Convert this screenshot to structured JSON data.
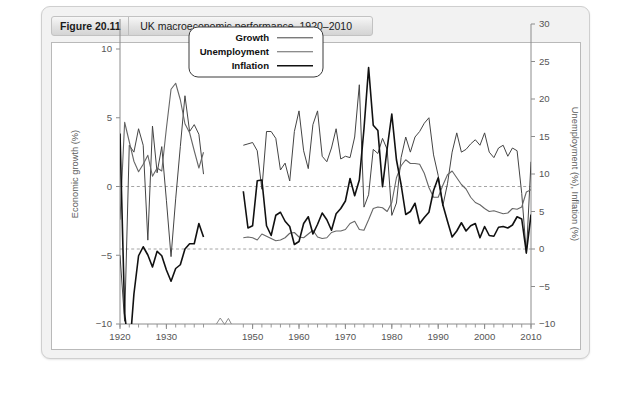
{
  "figure": {
    "number": "Figure 20.11",
    "title": "UK macroeconomic performance, 1920–2010"
  },
  "chart_data": {
    "type": "line",
    "title": "UK macroeconomic performance, 1920–2010",
    "xlabel": "",
    "ylabel": "Economic growth (%)",
    "y2label": "Unemployment (%), Inflation (%)",
    "xlim": [
      1920,
      2010
    ],
    "ylim": [
      -10,
      12
    ],
    "y2lim": [
      -10,
      30
    ],
    "grid": false,
    "zero_reference_lines": [
      {
        "axis": "left",
        "value": 0,
        "style": "dashed"
      },
      {
        "axis": "right",
        "value": 0,
        "style": "dashed"
      }
    ],
    "axis_break": {
      "between": [
        1938,
        1948
      ],
      "marker": "zigzag-notch"
    },
    "xticks": [
      1920,
      1930,
      1950,
      1960,
      1970,
      1980,
      1990,
      2000,
      2010
    ],
    "xtick_labels": [
      "1920",
      "1930",
      "1950",
      "1960",
      "1970",
      "1980",
      "1990",
      "2000",
      "2010"
    ],
    "yticks": [
      10,
      5,
      0,
      -5,
      -10
    ],
    "ytick_labels": [
      "10",
      "5",
      "0",
      "−5",
      "−10"
    ],
    "y2ticks": [
      30,
      25,
      20,
      15,
      10,
      5,
      0,
      -5,
      -10
    ],
    "y2tick_labels": [
      "30",
      "25",
      "20",
      "15",
      "10",
      "5",
      "0",
      "−5",
      "−10"
    ],
    "legend_position": "top-center",
    "series": [
      {
        "name": "Growth",
        "axis": "left",
        "color": "#444444",
        "linewidth": 1.0,
        "x": [
          1920,
          1921,
          1922,
          1923,
          1924,
          1925,
          1926,
          1927,
          1928,
          1929,
          1930,
          1931,
          1932,
          1933,
          1934,
          1935,
          1936,
          1937,
          1938,
          1948,
          1949,
          1950,
          1951,
          1952,
          1953,
          1954,
          1955,
          1956,
          1957,
          1958,
          1959,
          1960,
          1961,
          1962,
          1963,
          1964,
          1965,
          1966,
          1967,
          1968,
          1969,
          1970,
          1971,
          1972,
          1973,
          1974,
          1975,
          1976,
          1977,
          1978,
          1979,
          1980,
          1981,
          1982,
          1983,
          1984,
          1985,
          1986,
          1987,
          1988,
          1989,
          1990,
          1991,
          1992,
          1993,
          1994,
          1995,
          1996,
          1997,
          1998,
          1999,
          2000,
          2001,
          2002,
          2003,
          2004,
          2005,
          2006,
          2007,
          2008,
          2009,
          2010
        ],
        "y": [
          -5.0,
          -9.8,
          3.0,
          2.5,
          4.2,
          3.0,
          -3.9,
          4.4,
          1.0,
          2.9,
          -1.0,
          -5.1,
          -0.9,
          2.9,
          6.6,
          4.0,
          4.5,
          3.8,
          0.9,
          3.0,
          3.1,
          3.2,
          2.6,
          -0.2,
          4.0,
          4.0,
          3.5,
          1.2,
          1.7,
          0.4,
          4.0,
          5.5,
          2.6,
          1.3,
          4.5,
          5.5,
          2.2,
          1.8,
          2.8,
          4.2,
          2.0,
          2.2,
          2.1,
          3.6,
          7.4,
          -1.5,
          -0.6,
          2.7,
          2.4,
          3.5,
          2.7,
          -2.1,
          -1.2,
          2.1,
          3.6,
          2.5,
          3.6,
          4.0,
          4.6,
          5.0,
          2.3,
          0.8,
          -1.4,
          0.2,
          2.5,
          3.9,
          2.5,
          2.7,
          3.1,
          3.4,
          3.0,
          3.9,
          2.5,
          2.1,
          2.8,
          3.0,
          2.2,
          2.8,
          2.6,
          -0.5,
          -4.9,
          1.8
        ]
      },
      {
        "name": "Unemployment",
        "axis": "right",
        "color": "#666666",
        "linewidth": 1.1,
        "x": [
          1920,
          1921,
          1922,
          1923,
          1924,
          1925,
          1926,
          1927,
          1928,
          1929,
          1930,
          1931,
          1932,
          1933,
          1934,
          1935,
          1936,
          1937,
          1938,
          1948,
          1949,
          1950,
          1951,
          1952,
          1953,
          1954,
          1955,
          1956,
          1957,
          1958,
          1959,
          1960,
          1961,
          1962,
          1963,
          1964,
          1965,
          1966,
          1967,
          1968,
          1969,
          1970,
          1971,
          1972,
          1973,
          1974,
          1975,
          1976,
          1977,
          1978,
          1979,
          1980,
          1981,
          1982,
          1983,
          1984,
          1985,
          1986,
          1987,
          1988,
          1989,
          1990,
          1991,
          1992,
          1993,
          1994,
          1995,
          1996,
          1997,
          1998,
          1999,
          2000,
          2001,
          2002,
          2003,
          2004,
          2005,
          2006,
          2007,
          2008,
          2009,
          2010
        ],
        "y": [
          3.9,
          16.9,
          14.3,
          11.7,
          10.3,
          11.3,
          12.5,
          9.7,
          10.8,
          10.4,
          16.1,
          21.3,
          22.1,
          19.9,
          16.7,
          15.5,
          13.1,
          10.8,
          12.9,
          1.5,
          1.6,
          1.5,
          1.2,
          2.0,
          1.7,
          1.4,
          1.1,
          1.2,
          1.5,
          2.1,
          2.2,
          1.6,
          1.5,
          2.0,
          2.5,
          1.6,
          1.4,
          1.5,
          2.2,
          2.4,
          2.4,
          2.6,
          3.4,
          3.7,
          2.6,
          2.5,
          3.9,
          5.4,
          5.6,
          5.5,
          5.0,
          6.2,
          9.5,
          11.1,
          11.9,
          11.4,
          11.4,
          11.3,
          10.1,
          8.2,
          6.9,
          6.9,
          8.5,
          9.9,
          10.4,
          9.5,
          8.6,
          8.0,
          6.9,
          6.2,
          5.9,
          5.4,
          5.0,
          5.1,
          4.9,
          4.7,
          4.8,
          5.4,
          5.3,
          5.6,
          7.6,
          7.9
        ]
      },
      {
        "name": "Inflation",
        "axis": "right",
        "color": "#111111",
        "linewidth": 1.6,
        "x": [
          1920,
          1921,
          1922,
          1923,
          1924,
          1925,
          1926,
          1927,
          1928,
          1929,
          1930,
          1931,
          1932,
          1933,
          1934,
          1935,
          1936,
          1937,
          1938,
          1948,
          1949,
          1950,
          1951,
          1952,
          1953,
          1954,
          1955,
          1956,
          1957,
          1958,
          1959,
          1960,
          1961,
          1962,
          1963,
          1964,
          1965,
          1966,
          1967,
          1968,
          1969,
          1970,
          1971,
          1972,
          1973,
          1974,
          1975,
          1976,
          1977,
          1978,
          1979,
          1980,
          1981,
          1982,
          1983,
          1984,
          1985,
          1986,
          1987,
          1988,
          1989,
          1990,
          1991,
          1992,
          1993,
          1994,
          1995,
          1996,
          1997,
          1998,
          1999,
          2000,
          2001,
          2002,
          2003,
          2004,
          2005,
          2006,
          2007,
          2008,
          2009,
          2010
        ],
        "y": [
          15.4,
          -8.6,
          -14.0,
          -6.0,
          -0.9,
          0.3,
          -0.8,
          -2.4,
          -0.3,
          -0.9,
          -2.8,
          -4.3,
          -2.6,
          -2.1,
          0.0,
          0.7,
          0.7,
          3.4,
          1.6,
          7.7,
          2.8,
          3.1,
          9.1,
          9.2,
          3.1,
          1.8,
          4.5,
          4.9,
          3.7,
          3.0,
          0.6,
          1.0,
          3.4,
          4.3,
          2.0,
          3.3,
          4.8,
          3.9,
          2.5,
          4.7,
          5.4,
          6.4,
          9.4,
          7.1,
          9.2,
          16.0,
          24.2,
          16.5,
          15.8,
          8.3,
          13.4,
          18.0,
          11.9,
          8.6,
          4.6,
          5.0,
          6.1,
          3.4,
          4.2,
          4.9,
          7.8,
          9.5,
          5.9,
          3.7,
          1.6,
          2.4,
          3.5,
          2.4,
          3.1,
          3.4,
          1.5,
          3.0,
          1.8,
          1.7,
          2.9,
          3.0,
          2.8,
          3.2,
          4.3,
          4.0,
          -0.5,
          4.6
        ]
      }
    ]
  },
  "legend": {
    "items": [
      {
        "label": "Growth"
      },
      {
        "label": "Unemployment"
      },
      {
        "label": "Inflation"
      }
    ]
  }
}
